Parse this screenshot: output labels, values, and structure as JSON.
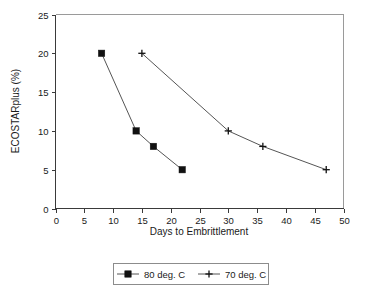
{
  "chart_data": {
    "type": "line",
    "title": "",
    "xlabel": "Days to Embrittlement",
    "ylabel": "ECOSTARplus (%)",
    "xlim": [
      0,
      50
    ],
    "ylim": [
      0,
      25
    ],
    "xticks": [
      0,
      5,
      10,
      15,
      20,
      25,
      30,
      35,
      40,
      45,
      50
    ],
    "yticks": [
      0,
      5,
      10,
      15,
      20,
      25
    ],
    "xtick_labels": [
      "0",
      "5",
      "10",
      "15",
      "20",
      "25",
      "30",
      "35",
      "40",
      "45",
      "50"
    ],
    "ytick_labels": [
      "0",
      "5",
      "10",
      "15",
      "20",
      "25"
    ],
    "grid": false,
    "legend_position": "below-center",
    "series": [
      {
        "name": "80 deg. C",
        "marker": "filled-square",
        "color": "#111111",
        "points": [
          {
            "x": 8,
            "y": 20
          },
          {
            "x": 14,
            "y": 10
          },
          {
            "x": 17,
            "y": 8
          },
          {
            "x": 22,
            "y": 5
          }
        ]
      },
      {
        "name": "70 deg. C",
        "marker": "plus",
        "color": "#111111",
        "points": [
          {
            "x": 15,
            "y": 20
          },
          {
            "x": 30,
            "y": 10
          },
          {
            "x": 36,
            "y": 8
          },
          {
            "x": 47,
            "y": 5
          }
        ]
      }
    ]
  },
  "legend": {
    "entries": [
      {
        "label": "80 deg. C",
        "marker": "filled-square"
      },
      {
        "label": "70 deg. C",
        "marker": "plus"
      }
    ]
  },
  "axes": {
    "x_title": "Days to Embrittlement",
    "y_title": "ECOSTARplus (%)"
  }
}
